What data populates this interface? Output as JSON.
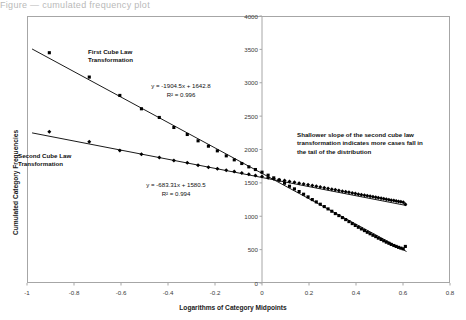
{
  "top_sliver": "Figure — cumulated frequency plot",
  "chart_data": {
    "type": "scatter",
    "title": "",
    "xlabel": "Logarithms of Category Midpoints",
    "ylabel": "Cumulated Category Frequencies",
    "xlim": [
      -1,
      0.8
    ],
    "ylim": [
      0,
      4000
    ],
    "xticks": [
      "-1",
      "-0.8",
      "-0.6",
      "-0.4",
      "-0.2",
      "0",
      "0.2",
      "0.4",
      "0.6",
      "0.8"
    ],
    "xtick_values": [
      -1,
      -0.8,
      -0.6,
      -0.4,
      -0.2,
      0,
      0.2,
      0.4,
      0.6,
      0.8
    ],
    "yticks": [
      "0",
      "500",
      "1000",
      "1500",
      "2000",
      "2500",
      "3000",
      "3500",
      "4000"
    ],
    "ytick_values": [
      0,
      500,
      1000,
      1500,
      2000,
      2500,
      3000,
      3500,
      4000
    ],
    "grid": false,
    "legend_position": "none",
    "vertical_axis_line_at_x": 0,
    "series": [
      {
        "name": "First Cube Law Transformation",
        "marker": "square",
        "color": "#000000",
        "trendline": {
          "equation": "y = -1904.5x + 1642.8",
          "slope": -1904.5,
          "intercept": 1642.8,
          "r_squared": 0.996,
          "r_squared_label": "R² = 0.996"
        },
        "points": [
          [
            -0.905,
            3450
          ],
          [
            -0.735,
            3085
          ],
          [
            -0.605,
            2810
          ],
          [
            -0.513,
            2610
          ],
          [
            -0.437,
            2480
          ],
          [
            -0.375,
            2330
          ],
          [
            -0.318,
            2225
          ],
          [
            -0.272,
            2130
          ],
          [
            -0.228,
            2050
          ],
          [
            -0.19,
            1980
          ],
          [
            -0.152,
            1905
          ],
          [
            -0.118,
            1845
          ],
          [
            -0.086,
            1790
          ],
          [
            -0.056,
            1740
          ],
          [
            -0.028,
            1700
          ],
          [
            0.0,
            1660
          ],
          [
            0.026,
            1615
          ],
          [
            0.05,
            1575
          ],
          [
            0.073,
            1540
          ],
          [
            0.096,
            1495
          ],
          [
            0.117,
            1450
          ],
          [
            0.138,
            1410
          ],
          [
            0.158,
            1370
          ],
          [
            0.177,
            1330
          ],
          [
            0.196,
            1290
          ],
          [
            0.214,
            1250
          ],
          [
            0.231,
            1215
          ],
          [
            0.248,
            1180
          ],
          [
            0.265,
            1145
          ],
          [
            0.281,
            1110
          ],
          [
            0.297,
            1075
          ],
          [
            0.312,
            1040
          ],
          [
            0.327,
            1010
          ],
          [
            0.342,
            980
          ],
          [
            0.356,
            950
          ],
          [
            0.37,
            920
          ],
          [
            0.384,
            890
          ],
          [
            0.397,
            862
          ],
          [
            0.41,
            835
          ],
          [
            0.423,
            810
          ],
          [
            0.436,
            785
          ],
          [
            0.448,
            760
          ],
          [
            0.46,
            738
          ],
          [
            0.472,
            715
          ],
          [
            0.484,
            695
          ],
          [
            0.495,
            672
          ],
          [
            0.507,
            652
          ],
          [
            0.518,
            632
          ],
          [
            0.529,
            612
          ],
          [
            0.54,
            595
          ],
          [
            0.55,
            578
          ],
          [
            0.561,
            562
          ],
          [
            0.571,
            548
          ],
          [
            0.581,
            534
          ],
          [
            0.591,
            522
          ],
          [
            0.601,
            512
          ],
          [
            0.61,
            548
          ]
        ]
      },
      {
        "name": "Second Cube Law Transformation",
        "marker": "diamond",
        "color": "#000000",
        "trendline": {
          "equation": "y = -683.31x + 1580.5",
          "slope": -683.31,
          "intercept": 1580.5,
          "r_squared": 0.994,
          "r_squared_label": "R² = 0.994"
        },
        "points": [
          [
            -0.905,
            2265
          ],
          [
            -0.735,
            2115
          ],
          [
            -0.605,
            1985
          ],
          [
            -0.513,
            1930
          ],
          [
            -0.437,
            1880
          ],
          [
            -0.375,
            1835
          ],
          [
            -0.318,
            1800
          ],
          [
            -0.272,
            1765
          ],
          [
            -0.228,
            1735
          ],
          [
            -0.19,
            1710
          ],
          [
            -0.152,
            1690
          ],
          [
            -0.118,
            1670
          ],
          [
            -0.086,
            1648
          ],
          [
            -0.056,
            1628
          ],
          [
            -0.028,
            1612
          ],
          [
            0.0,
            1595
          ],
          [
            0.026,
            1578
          ],
          [
            0.05,
            1562
          ],
          [
            0.073,
            1548
          ],
          [
            0.096,
            1534
          ],
          [
            0.117,
            1520
          ],
          [
            0.138,
            1508
          ],
          [
            0.158,
            1496
          ],
          [
            0.177,
            1484
          ],
          [
            0.196,
            1472
          ],
          [
            0.214,
            1460
          ],
          [
            0.231,
            1449
          ],
          [
            0.248,
            1438
          ],
          [
            0.265,
            1427
          ],
          [
            0.281,
            1416
          ],
          [
            0.297,
            1406
          ],
          [
            0.312,
            1396
          ],
          [
            0.327,
            1386
          ],
          [
            0.342,
            1376
          ],
          [
            0.356,
            1367
          ],
          [
            0.37,
            1358
          ],
          [
            0.384,
            1349
          ],
          [
            0.397,
            1340
          ],
          [
            0.41,
            1331
          ],
          [
            0.423,
            1323
          ],
          [
            0.436,
            1315
          ],
          [
            0.448,
            1307
          ],
          [
            0.46,
            1299
          ],
          [
            0.472,
            1291
          ],
          [
            0.484,
            1284
          ],
          [
            0.495,
            1276
          ],
          [
            0.507,
            1269
          ],
          [
            0.518,
            1262
          ],
          [
            0.529,
            1255
          ],
          [
            0.54,
            1248
          ],
          [
            0.55,
            1241
          ],
          [
            0.561,
            1235
          ],
          [
            0.571,
            1228
          ],
          [
            0.581,
            1222
          ],
          [
            0.591,
            1216
          ],
          [
            0.601,
            1210
          ],
          [
            0.61,
            1178
          ]
        ]
      }
    ],
    "annotations": [
      {
        "id": "label-first",
        "text": "First Cube Law\nTransformation"
      },
      {
        "id": "label-second",
        "text": "Second Cube Law\nTransformation"
      },
      {
        "id": "note-shallower-slope",
        "text": "Shallower slope of the second cube law\ntransformation indicates more cases fall in\nthe tail of the distribution"
      }
    ]
  }
}
